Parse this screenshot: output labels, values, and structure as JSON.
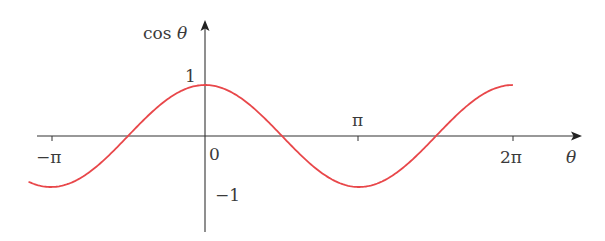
{
  "chart_data": {
    "type": "line",
    "title": "",
    "xlabel": "θ",
    "ylabel": "cos θ",
    "function": "cos",
    "x_range": [
      -3.6,
      6.28
    ],
    "xlim": [
      -3.14159,
      6.28318
    ],
    "ylim": [
      -1,
      1
    ],
    "grid": false,
    "legend": null,
    "x_ticks": [
      {
        "value": -3.14159,
        "label": "−π"
      },
      {
        "value": 0,
        "label": "0"
      },
      {
        "value": 3.14159,
        "label": "π"
      },
      {
        "value": 6.28318,
        "label": "2π"
      }
    ],
    "y_ticks": [
      {
        "value": 1,
        "label": "1"
      },
      {
        "value": -1,
        "label": "−1"
      }
    ],
    "series": [
      {
        "name": "cos θ",
        "color": "#e8474a",
        "x": [
          -3.6,
          -3.14159,
          -1.5708,
          0,
          1.5708,
          3.14159,
          4.71239,
          6.28318
        ],
        "values": [
          -0.8968,
          -1,
          0,
          1,
          0,
          -1,
          0,
          1
        ]
      }
    ]
  },
  "labels": {
    "y_axis": "cos θ",
    "x_axis": "θ",
    "tick_neg_pi": "−π",
    "tick_zero": "0",
    "tick_pi": "π",
    "tick_two_pi": "2π",
    "tick_one": "1",
    "tick_neg_one": "−1"
  },
  "colors": {
    "curve": "#e8474a",
    "axis": "#333333",
    "text": "#3a3a3a"
  }
}
